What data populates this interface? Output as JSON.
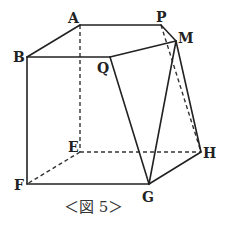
{
  "figure": {
    "caption": "＜図 5＞",
    "colors": {
      "line": "#222222",
      "background": "#ffffff"
    },
    "vertices": {
      "A": {
        "label": "A",
        "x": 80,
        "y": 25
      },
      "P": {
        "label": "P",
        "x": 161,
        "y": 25
      },
      "M": {
        "label": "M",
        "x": 176,
        "y": 41
      },
      "B": {
        "label": "B",
        "x": 27,
        "y": 57
      },
      "Q": {
        "label": "Q",
        "x": 110,
        "y": 57
      },
      "E": {
        "label": "E",
        "x": 80,
        "y": 152
      },
      "F": {
        "label": "F",
        "x": 27,
        "y": 184
      },
      "G": {
        "label": "G",
        "x": 149,
        "y": 184
      },
      "H": {
        "label": "H",
        "x": 201,
        "y": 152
      }
    },
    "solid_edges": [
      "A-P",
      "P-M",
      "A-B",
      "B-Q",
      "Q-M",
      "B-F",
      "F-G",
      "G-H",
      "Q-G",
      "M-G",
      "M-H"
    ],
    "dashed_edges": [
      "A-E",
      "E-F",
      "E-H",
      "P-H"
    ]
  }
}
